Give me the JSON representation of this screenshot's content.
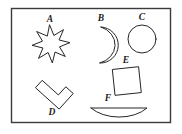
{
  "figure": {
    "background_color": "#ffffff",
    "frame": {
      "stroke_color": "#3a3a3a",
      "x": 11,
      "y": 8,
      "width": 159,
      "height": 114
    },
    "shape_stroke_color": "#262626",
    "shape_fill_color": "#ffffff",
    "label_color": "#1a1a1a",
    "shapes": [
      {
        "label": "A",
        "icon": "eight-pointed-star-icon",
        "kind": "star",
        "points": 8,
        "label_x": 50,
        "label_y": 20,
        "center_x": 51,
        "center_y": 44,
        "outer_radius": 19,
        "inner_radius": 9,
        "rotation_deg": -4
      },
      {
        "label": "B",
        "icon": "crescent-moon-icon",
        "kind": "crescent",
        "label_x": 101,
        "label_y": 19,
        "center_x": 102,
        "center_y": 45,
        "radius": 18
      },
      {
        "label": "C",
        "icon": "circle-icon",
        "kind": "circle",
        "label_x": 142,
        "label_y": 18,
        "center_x": 142,
        "center_y": 39,
        "radius": 14
      },
      {
        "label": "D",
        "icon": "rotated-cross-icon",
        "kind": "cross",
        "label_x": 52,
        "label_y": 113,
        "center_x": 51,
        "center_y": 95,
        "rotation_deg": 42
      },
      {
        "label": "E",
        "icon": "tilted-square-icon",
        "kind": "square",
        "label_x": 126,
        "label_y": 61,
        "center_x": 127,
        "center_y": 81,
        "side": 26,
        "rotation_deg": -6
      },
      {
        "label": "F",
        "icon": "half-disk-icon",
        "kind": "half-disk",
        "label_x": 108,
        "label_y": 99,
        "center_x": 119,
        "center_y": 108,
        "half_width": 28,
        "depth": 12
      }
    ]
  }
}
